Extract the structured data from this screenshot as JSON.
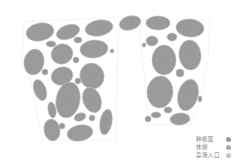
{
  "colors": {
    "plot_fill": "#9a9a9a",
    "plot_stroke": "#bdbdbd",
    "boundary": "#d8d8d8",
    "background": "#ffffff"
  },
  "legend": [
    {
      "label": "种植区",
      "color": "#9a9a9a"
    },
    {
      "label": "休憩",
      "color": "#a8a8a8"
    },
    {
      "label": "菜场入口",
      "color": "#c4c4c4"
    }
  ],
  "plots": {
    "left_group_count": 24,
    "right_group_count": 16
  }
}
